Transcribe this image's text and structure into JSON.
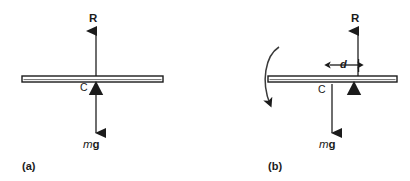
{
  "figure": {
    "background_color": "#ffffff",
    "ink_color": "#1b1b1b",
    "width": 410,
    "height": 181
  },
  "panels": [
    {
      "id": "a",
      "caption": "(a)",
      "description": "Uniform beam resting symmetrically on a triangular pivot; reaction R acts up through the centre of gravity C and weight mg acts down through C, so the beam balances.",
      "beam": {
        "x_left": 22,
        "x_right": 163,
        "y_top": 76,
        "height": 6,
        "fill": "#ffffff",
        "stroke": "#1b1b1b"
      },
      "pivot": {
        "x_center": 96,
        "width": 14,
        "height": 13,
        "fill": "#1b1b1b",
        "shape": "solid-triangle"
      },
      "labels": {
        "reaction": "R",
        "centre_of_gravity": "C",
        "weight_italic": "m",
        "weight_bold": "g",
        "weight_full": "mg"
      },
      "arrows": {
        "reaction": {
          "x": 96,
          "y_tail": 76,
          "y_head": 30,
          "direction": "up"
        },
        "weight": {
          "x": 96,
          "y_tail": 82,
          "y_head": 133,
          "direction": "down"
        }
      }
    },
    {
      "id": "b",
      "caption": "(b)",
      "description": "The same beam with the pivot displaced a distance d to the right of the centre of gravity C; the couple formed by R and mg rotates the beam, shown by the curved arrow on the left.",
      "beam": {
        "x_left": 268,
        "x_right": 397,
        "y_top": 76,
        "height": 6,
        "fill": "#ffffff",
        "stroke": "#1b1b1b"
      },
      "pivot": {
        "x_center": 354,
        "width": 14,
        "height": 13,
        "fill": "#1b1b1b",
        "shape": "solid-triangle"
      },
      "labels": {
        "reaction": "R",
        "centre_of_gravity": "C",
        "weight_italic": "m",
        "weight_bold": "g",
        "weight_full": "mg",
        "offset_distance": "d"
      },
      "arrows": {
        "reaction": {
          "x": 358,
          "y_tail": 76,
          "y_head": 30,
          "direction": "up"
        },
        "weight": {
          "x": 332,
          "y_tail": 82,
          "y_head": 133,
          "direction": "down"
        },
        "rotation": {
          "direction": "clockwise-about-pivot",
          "x_start": 278,
          "y_start": 47,
          "x_end": 277,
          "y_end": 113
        }
      },
      "dimension": {
        "label": "d",
        "x_from": 330,
        "x_to": 359,
        "y": 65,
        "style": "double-headed-arrow"
      }
    }
  ]
}
